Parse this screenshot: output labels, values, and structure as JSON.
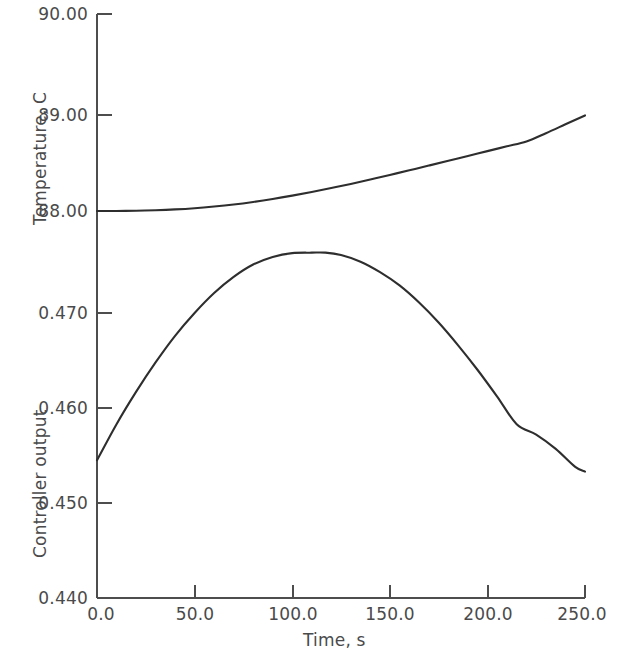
{
  "chart_data": [
    {
      "type": "line",
      "title": "",
      "panel": "upper",
      "xlabel": "Time, s",
      "ylabel": "Temperature, C",
      "xlim": [
        0,
        250
      ],
      "ylim": [
        88.0,
        90.0
      ],
      "grid": false,
      "legend": "none",
      "xticks": [
        0.0,
        50.0,
        100.0,
        150.0,
        200.0,
        250.0
      ],
      "xtick_labels": [
        "0.0",
        "50.0",
        "100.0",
        "150.0",
        "200.0",
        "250.0"
      ],
      "yticks": [
        88.0,
        89.0,
        90.0
      ],
      "ytick_labels": [
        "88.00",
        "89.00",
        "90.00"
      ],
      "series": [
        {
          "name": "Temperature",
          "x": [
            0,
            10,
            20,
            30,
            40,
            50,
            60,
            70,
            80,
            90,
            100,
            110,
            120,
            130,
            140,
            150,
            160,
            170,
            180,
            190,
            200,
            210,
            220,
            230,
            240,
            250
          ],
          "y": [
            88.0,
            88.0,
            88.003,
            88.008,
            88.016,
            88.028,
            88.045,
            88.066,
            88.092,
            88.122,
            88.156,
            88.193,
            88.233,
            88.275,
            88.32,
            88.366,
            88.413,
            88.461,
            88.51,
            88.559,
            88.608,
            88.657,
            88.706,
            88.79,
            88.88,
            88.97
          ]
        }
      ]
    },
    {
      "type": "line",
      "title": "",
      "panel": "lower",
      "xlabel": "Time, s",
      "ylabel": "Controller output",
      "xlim": [
        0,
        250
      ],
      "ylim": [
        0.44,
        0.475
      ],
      "grid": false,
      "legend": "none",
      "xticks": [
        0.0,
        50.0,
        100.0,
        150.0,
        200.0,
        250.0
      ],
      "xtick_labels": [
        "0.0",
        "50.0",
        "100.0",
        "150.0",
        "200.0",
        "250.0"
      ],
      "yticks": [
        0.44,
        0.45,
        0.46,
        0.47
      ],
      "ytick_labels": [
        "0.440",
        "0.450",
        "0.460",
        "0.470"
      ],
      "series": [
        {
          "name": "Controller output",
          "x": [
            0,
            10,
            20,
            30,
            40,
            50,
            60,
            70,
            80,
            90,
            100,
            110,
            117,
            125,
            135,
            145,
            155,
            165,
            175,
            185,
            195,
            205,
            215,
            225,
            235,
            245,
            250
          ],
          "y": [
            0.4545,
            0.4583,
            0.4617,
            0.4648,
            0.4676,
            0.47,
            0.4721,
            0.4738,
            0.4751,
            0.4759,
            0.4763,
            0.47635,
            0.47635,
            0.4761,
            0.4754,
            0.4743,
            0.4729,
            0.4711,
            0.469,
            0.4666,
            0.464,
            0.4612,
            0.4583,
            0.4572,
            0.4557,
            0.4538,
            0.4533
          ]
        }
      ]
    }
  ],
  "axes": {
    "upper_ytitle": "Temperature, C",
    "lower_ytitle": "Controller output",
    "xtitle": "Time, s",
    "upper_ytick_labels": [
      "90.00",
      "89.00",
      "88.00"
    ],
    "lower_ytick_labels": [
      "0.470",
      "0.460",
      "0.450",
      "0.440"
    ],
    "xtick_labels": [
      "0.0",
      "50.0",
      "100.0",
      "150.0",
      "200.0",
      "250.0"
    ]
  },
  "colors": {
    "curve": "#2e2e2e",
    "axis": "#4d4d4d",
    "text": "#4a4a4a",
    "background": "#ffffff"
  }
}
